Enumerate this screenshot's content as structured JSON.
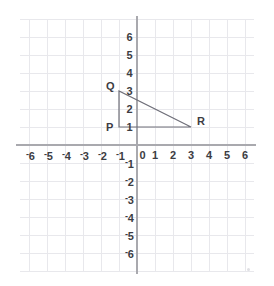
{
  "figure": {
    "background_color": "#ffffff",
    "grid_color": "#e8e8ec",
    "axis_color": "#a9a9ae",
    "label_color": "#3c3c42",
    "shape_color": "#6e6e78"
  },
  "axes": {
    "x_labels": [
      "-6",
      "-5",
      "-4",
      "-3",
      "-2",
      "-1",
      "0",
      "1",
      "2",
      "3",
      "4",
      "5",
      "6"
    ],
    "y_labels": [
      "6",
      "5",
      "4",
      "3",
      "2",
      "1",
      "-1",
      "-2",
      "-3",
      "-4",
      "-5",
      "-6"
    ],
    "origin_label": "0",
    "x_values": [
      -6,
      -5,
      -4,
      -3,
      -2,
      -1,
      0,
      1,
      2,
      3,
      4,
      5,
      6
    ],
    "y_values": [
      6,
      5,
      4,
      3,
      2,
      1,
      -1,
      -2,
      -3,
      -4,
      -5,
      -6
    ]
  },
  "chart_data": {
    "type": "scatter",
    "title": "",
    "xlabel": "",
    "ylabel": "",
    "xlim": [
      -6.5,
      6.5
    ],
    "ylim": [
      -6.5,
      6.5
    ],
    "grid": true,
    "legend": "none",
    "xticks": [
      -6,
      -5,
      -4,
      -3,
      -2,
      -1,
      0,
      1,
      2,
      3,
      4,
      5,
      6
    ],
    "yticks": [
      -6,
      -5,
      -4,
      -3,
      -2,
      -1,
      1,
      2,
      3,
      4,
      5,
      6
    ],
    "shapes": [
      {
        "name": "triangle-PQR",
        "kind": "polygon",
        "closed": true,
        "stroke": "#6e6e78",
        "fill": "none",
        "points": [
          {
            "label": "P",
            "x": -1,
            "y": 1
          },
          {
            "label": "Q",
            "x": -1,
            "y": 3
          },
          {
            "label": "R",
            "x": 3,
            "y": 1
          }
        ]
      }
    ],
    "annotations": [
      {
        "text": "Q",
        "x": -1,
        "y": 3,
        "position": "left-above"
      },
      {
        "text": "P",
        "x": -1,
        "y": 1,
        "position": "left"
      },
      {
        "text": "R",
        "x": 3,
        "y": 1,
        "position": "right-above"
      }
    ]
  }
}
